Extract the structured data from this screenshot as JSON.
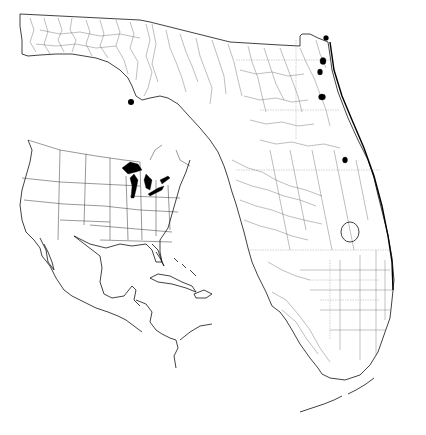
{
  "map": {
    "subject": "Florida drainage / hydrography map with inset locator map",
    "background_color": "#ffffff",
    "ink_color": "#000000",
    "main_map": {
      "region": "Florida",
      "features": [
        "coastline",
        "rivers and streams",
        "lakes",
        "canals (south Florida grid)",
        "Florida Keys"
      ],
      "markers": [
        {
          "name": "panhandle-point-marker",
          "x": 131,
          "y": 102,
          "shape": "filled-circle"
        }
      ],
      "highlighted_lakes": [
        {
          "x": 326,
          "y": 38
        },
        {
          "x": 323,
          "y": 60
        },
        {
          "x": 320,
          "y": 72
        },
        {
          "x": 322,
          "y": 97
        },
        {
          "x": 345,
          "y": 160
        }
      ]
    },
    "inset_map": {
      "region": "Eastern North America, Mexico, Central America and Caribbean",
      "features": [
        "US state boundaries",
        "Mexico",
        "Central America",
        "Cuba",
        "Hispaniola",
        "Bahamas"
      ],
      "highlighted": "Great Lakes (filled black)"
    }
  }
}
